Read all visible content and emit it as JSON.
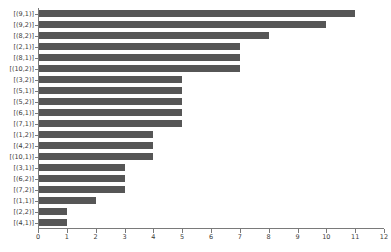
{
  "chart_data": {
    "type": "bar",
    "orientation": "horizontal",
    "title": "",
    "xlabel": "",
    "ylabel": "",
    "xlim": [
      0,
      12
    ],
    "ylim": null,
    "grid": false,
    "legend": null,
    "bar_color": "#565656",
    "axis_color": "#7a7a7a",
    "background_color": "#ffffff",
    "xticks": [
      0,
      1,
      2,
      3,
      4,
      5,
      6,
      7,
      8,
      9,
      10,
      11,
      12
    ],
    "xticklabels": [
      "0",
      "1",
      "2",
      "3",
      "4",
      "5",
      "6",
      "7",
      "8",
      "9",
      "10",
      "11",
      "12"
    ],
    "categories": [
      "[(9,1)]",
      "[(9,2)]",
      "[(8,2)]",
      "[(2,1)]",
      "[(8,1)]",
      "[(10,2)]",
      "[(3,2)]",
      "[(5,1)]",
      "[(5,2)]",
      "[(6,1)]",
      "[(7,1)]",
      "[(1,2)]",
      "[(4,2)]",
      "[(10,1)]",
      "[(3,1)]",
      "[(6,2)]",
      "[(7,2)]",
      "[(1,1)]",
      "[(2,2)]",
      "[(4,1)]"
    ],
    "values": [
      11,
      10,
      8,
      7,
      7,
      7,
      5,
      5,
      5,
      5,
      5,
      4,
      4,
      4,
      3,
      3,
      3,
      2,
      1,
      1
    ]
  }
}
